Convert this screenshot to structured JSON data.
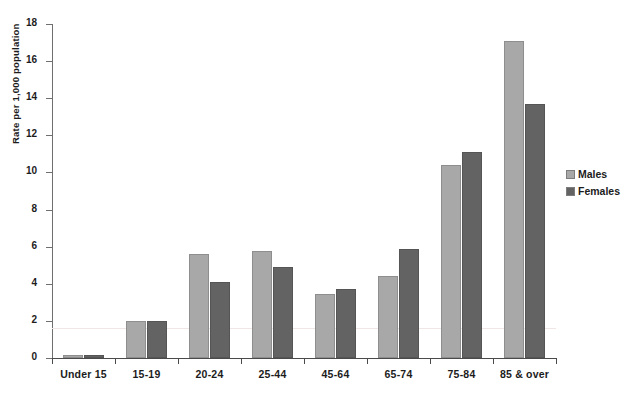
{
  "chart_data": {
    "type": "bar",
    "title": "",
    "xlabel": "",
    "ylabel": "Rate per 1,000 population",
    "ylim": [
      0,
      18
    ],
    "ytick_step": 2,
    "ytick_labels": [
      "0",
      "2",
      "4",
      "6",
      "8",
      "10",
      "12",
      "14",
      "16",
      "18"
    ],
    "grid": false,
    "legend_position": "right",
    "categories": [
      "Under 15",
      "15-19",
      "20-24",
      "25-44",
      "45-64",
      "65-74",
      "75-84",
      "85 & over"
    ],
    "series": [
      {
        "name": "Males",
        "color": "#a8a8a8",
        "values": [
          0.15,
          2.0,
          5.6,
          5.75,
          3.45,
          4.4,
          10.4,
          17.1
        ]
      },
      {
        "name": "Females",
        "color": "#636363",
        "values": [
          0.15,
          2.0,
          4.1,
          4.9,
          3.7,
          5.85,
          11.1,
          13.7
        ]
      }
    ]
  },
  "legend": {
    "items": [
      {
        "label": "Males"
      },
      {
        "label": "Females"
      }
    ]
  }
}
